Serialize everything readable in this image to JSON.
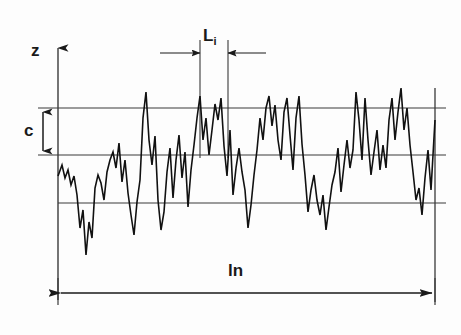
{
  "figure": {
    "background_color": "#fdfdfd",
    "line_color": "#1a1a1a",
    "grid_color": "#3a3a3a"
  },
  "labels": {
    "z_axis": "z",
    "c_dimension": "c",
    "Li_base": "L",
    "Li_subscript": "i",
    "ln_base": "l",
    "ln_subscript": "n"
  },
  "chart_data": {
    "type": "line",
    "xlabel": "ln",
    "ylabel": "z",
    "grid": true,
    "legend": null,
    "xlim": [
      0,
      377
    ],
    "ylim": [
      -118,
      72
    ],
    "reference_lines": [
      {
        "name": "upper-level-line",
        "y_px": 108,
        "label": ""
      },
      {
        "name": "mean-line",
        "y_px": 155,
        "label": ""
      },
      {
        "name": "lower-level-line",
        "y_px": 203,
        "label": ""
      }
    ],
    "annotations": [
      {
        "name": "c",
        "text": "c",
        "type": "vertical-dimension",
        "from_y_px": 108,
        "to_y_px": 155,
        "x_px": 43
      },
      {
        "name": "Li",
        "text": "Li",
        "type": "horizontal-dimension",
        "from_x_px": 200,
        "to_x_px": 228,
        "y_px": 53
      },
      {
        "name": "ln",
        "text": "ln",
        "type": "horizontal-dimension",
        "from_x_px": 58,
        "to_x_px": 435,
        "y_px": 293
      }
    ],
    "series": [
      {
        "name": "roughness-profile",
        "x": [
          58,
          62,
          65,
          68,
          71,
          74,
          77,
          80,
          83,
          86,
          89,
          92,
          95,
          98,
          101,
          104,
          107,
          110,
          113,
          116,
          119,
          122,
          125,
          128,
          131,
          134,
          137,
          140,
          143,
          146,
          149,
          152,
          155,
          158,
          161,
          164,
          167,
          170,
          173,
          176,
          179,
          182,
          185,
          188,
          191,
          194,
          197,
          200,
          203,
          206,
          209,
          212,
          215,
          218,
          221,
          224,
          227,
          230,
          233,
          236,
          239,
          242,
          245,
          248,
          251,
          254,
          257,
          260,
          263,
          266,
          269,
          272,
          275,
          278,
          281,
          284,
          287,
          290,
          293,
          296,
          299,
          302,
          305,
          308,
          311,
          314,
          317,
          320,
          323,
          326,
          329,
          332,
          335,
          338,
          341,
          344,
          347,
          350,
          353,
          356,
          359,
          362,
          365,
          368,
          371,
          374,
          377,
          380,
          383,
          386,
          389,
          392,
          395,
          398,
          401,
          404,
          407,
          410,
          413,
          416,
          419,
          422,
          425,
          428,
          431,
          435
        ],
        "y_px": [
          176,
          165,
          178,
          170,
          185,
          176,
          195,
          228,
          210,
          255,
          222,
          238,
          188,
          175,
          183,
          200,
          172,
          160,
          152,
          168,
          143,
          182,
          160,
          193,
          215,
          235,
          202,
          180,
          118,
          92,
          140,
          165,
          136,
          200,
          230,
          212,
          172,
          148,
          198,
          160,
          135,
          178,
          152,
          207,
          170,
          145,
          118,
          96,
          140,
          118,
          155,
          130,
          104,
          120,
          98,
          146,
          176,
          130,
          195,
          168,
          148,
          172,
          190,
          228,
          205,
          175,
          150,
          118,
          140,
          108,
          96,
          126,
          105,
          140,
          160,
          112,
          98,
          135,
          170,
          118,
          96,
          144,
          175,
          212,
          190,
          175,
          200,
          215,
          195,
          230,
          207,
          185,
          172,
          148,
          192,
          165,
          140,
          168,
          150,
          92,
          120,
          160,
          98,
          140,
          175,
          152,
          130,
          170,
          145,
          168,
          120,
          98,
          140,
          112,
          88,
          130,
          108,
          145,
          172,
          200,
          188,
          215,
          178,
          150,
          190,
          120
        ]
      }
    ]
  }
}
